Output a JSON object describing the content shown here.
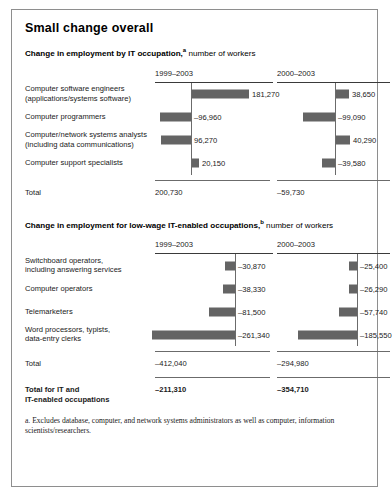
{
  "figure": {
    "title": "Small change overall",
    "footnotes": [
      "a. Excludes database, computer, and network systems administrators as well as computer, information scientists/researchers."
    ]
  },
  "sections": [
    {
      "title_bold": "Change in employment by IT occupation,",
      "title_sup": "a",
      "title_normal": " number of workers",
      "col_headers": [
        "1999–2003",
        "2000–2003"
      ],
      "rows": [
        {
          "label": "Computer software engineers\n(applications/systems software)",
          "v1": "181,270",
          "v2": "38,650"
        },
        {
          "label": "Computer programmers",
          "v1": "–96,960",
          "v2": "–99,090"
        },
        {
          "label": "Computer/network systems analysts\n(including data communications)",
          "v1": "96,270",
          "v2": "40,290"
        },
        {
          "label": "Computer support specialists",
          "v1": "20,150",
          "v2": "–39,580"
        }
      ],
      "total": {
        "label": "Total",
        "v1": "200,730",
        "v2": "–59,730"
      }
    },
    {
      "title_bold": "Change in employment for low-wage IT-enabled occupations,",
      "title_sup": "b",
      "title_normal": " number of workers",
      "col_headers": [
        "1999–2003",
        "2000–2003"
      ],
      "rows": [
        {
          "label": "Switchboard operators,\nincluding answering services",
          "v1": "–30,870",
          "v2": "–25,400"
        },
        {
          "label": "Computer operators",
          "v1": "–38,330",
          "v2": "–26,290"
        },
        {
          "label": "Telemarketers",
          "v1": "–81,500",
          "v2": "–57,740"
        },
        {
          "label": "Word processors, typists,\ndata-entry clerks",
          "v1": "–261,340",
          "v2": "–185,550"
        }
      ],
      "total": {
        "label": "Total",
        "v1": "–412,040",
        "v2": "–294,980"
      }
    }
  ],
  "grand_total": {
    "label": "Total for IT and\nIT-enabled occupations",
    "v1": "–211,310",
    "v2": "–354,710"
  },
  "chart_data": [
    {
      "type": "bar",
      "title": "Change in employment by IT occupation, number of workers",
      "orientation": "horizontal",
      "categories": [
        "Computer software engineers (applications/systems software)",
        "Computer programmers",
        "Computer/network systems analysts (including data communications)",
        "Computer support specialists"
      ],
      "series": [
        {
          "name": "1999–2003",
          "values": [
            181270,
            -96960,
            96270,
            20150
          ],
          "total": 200730
        },
        {
          "name": "2000–2003",
          "values": [
            38650,
            -99090,
            40290,
            -39580
          ],
          "total": -59730
        }
      ],
      "xlabel": "number of workers",
      "ylabel": "",
      "grid": false,
      "legend": "column-headers"
    },
    {
      "type": "bar",
      "title": "Change in employment for low-wage IT-enabled occupations, number of workers",
      "orientation": "horizontal",
      "categories": [
        "Switchboard operators, including answering services",
        "Computer operators",
        "Telemarketers",
        "Word processors, typists, data-entry clerks"
      ],
      "series": [
        {
          "name": "1999–2003",
          "values": [
            -30870,
            -38330,
            -81500,
            -261340
          ],
          "total": -412040
        },
        {
          "name": "2000–2003",
          "values": [
            -25400,
            -26290,
            -57740,
            -185550
          ],
          "total": -294980
        }
      ],
      "xlabel": "number of workers",
      "ylabel": "",
      "grid": false,
      "legend": "column-headers"
    }
  ],
  "colors": {
    "bar": "#646464",
    "rule": "#6b6b6b",
    "border": "#8e8e8e"
  }
}
